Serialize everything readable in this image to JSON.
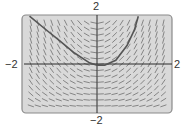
{
  "chart_data": {
    "type": "slope-field",
    "title": "",
    "xlabel": "",
    "ylabel": "",
    "xlim": [
      -2,
      2
    ],
    "ylim": [
      -2,
      2
    ],
    "tick_labels": {
      "top": "2",
      "bottom": "-2",
      "left": "-2",
      "right": "2"
    },
    "grid": false,
    "slope_rule": "dy/dx ≈ x(2 + y)",
    "solution_curve": {
      "x": [
        -1.8,
        -1.4,
        -1.0,
        -0.6,
        -0.2,
        0.0,
        0.2,
        0.5,
        0.8,
        1.0,
        1.1
      ],
      "y": [
        1.95,
        1.45,
        0.95,
        0.45,
        0.05,
        -0.05,
        -0.05,
        0.15,
        0.75,
        1.4,
        1.95
      ]
    },
    "colors": {
      "panel_fill": "#d9d9d9",
      "panel_border": "#8a8a8a",
      "axis": "#2a2a2a",
      "curve": "#555555",
      "slope_marks": "#6e6e6e"
    }
  },
  "labels": {
    "y_max": "2",
    "y_min": "−2",
    "x_min": "−2",
    "x_max": "2"
  }
}
